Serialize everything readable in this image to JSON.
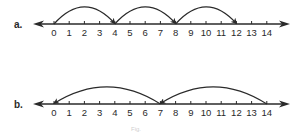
{
  "figure": {
    "caption": "Fig.",
    "colors": {
      "ink": "#2a2a2a",
      "background": "#ffffff",
      "caption": "#cfcfcf"
    },
    "number_lines": [
      {
        "id": "a",
        "label": "a.",
        "min": 0,
        "max": 14,
        "ticks": [
          "0",
          "1",
          "2",
          "3",
          "4",
          "5",
          "6",
          "7",
          "8",
          "9",
          "10",
          "11",
          "12",
          "13",
          "14"
        ],
        "jumps": [
          {
            "from": 0,
            "to": 4
          },
          {
            "from": 4,
            "to": 8
          },
          {
            "from": 8,
            "to": 12
          }
        ]
      },
      {
        "id": "b",
        "label": "b.",
        "min": 0,
        "max": 14,
        "ticks": [
          "0",
          "1",
          "2",
          "3",
          "4",
          "5",
          "6",
          "7",
          "8",
          "9",
          "10",
          "11",
          "12",
          "13",
          "14"
        ],
        "jumps": [
          {
            "from": 14,
            "to": 7
          },
          {
            "from": 7,
            "to": 0
          }
        ]
      }
    ]
  }
}
